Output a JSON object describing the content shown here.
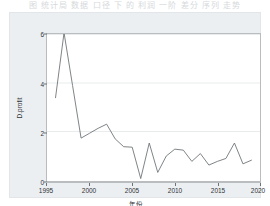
{
  "top_caption": "图 统计局 数据 口径 下 的 利润 一阶 差分 序列 走势",
  "chart_data": {
    "type": "line",
    "title": "",
    "xlabel": "年份",
    "ylabel": "D.profit",
    "xlim": [
      1995,
      2020
    ],
    "ylim": [
      0,
      6
    ],
    "xticks": [
      1995,
      2000,
      2005,
      2010,
      2015,
      2020
    ],
    "yticks": [
      0,
      2,
      4,
      6
    ],
    "grid": true,
    "grid_axis": "y",
    "legend": "none",
    "line_color": "#6f7478",
    "series": [
      {
        "name": "D.profit",
        "x": [
          1996,
          1997,
          1998,
          1999,
          2000,
          2001,
          2002,
          2003,
          2004,
          2005,
          2006,
          2007,
          2008,
          2009,
          2010,
          2011,
          2012,
          2013,
          2014,
          2015,
          2016,
          2017,
          2018,
          2019
        ],
        "values": [
          3.4,
          6.05,
          3.9,
          1.75,
          1.95,
          2.15,
          2.32,
          1.72,
          1.4,
          1.38,
          0.1,
          1.55,
          0.35,
          1.02,
          1.3,
          1.26,
          0.8,
          1.12,
          0.65,
          0.8,
          0.92,
          1.55,
          0.7,
          0.85
        ]
      }
    ]
  },
  "axes": {
    "x_tick_labels": [
      "1995",
      "2000",
      "2005",
      "2010",
      "2015",
      "2020"
    ],
    "y_tick_labels": [
      "0",
      "2",
      "4",
      "6"
    ],
    "x_title": "年份",
    "y_title": "D.profit"
  }
}
